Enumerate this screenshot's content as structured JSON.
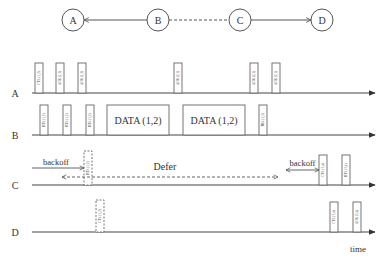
{
  "topology": {
    "nodes": [
      {
        "id": "A",
        "cx": 73,
        "cy": 20
      },
      {
        "id": "B",
        "cx": 158,
        "cy": 20
      },
      {
        "id": "C",
        "cx": 240,
        "cy": 20
      },
      {
        "id": "D",
        "cx": 322,
        "cy": 20
      }
    ],
    "links": [
      {
        "from": "B",
        "to": "A",
        "style": "solid",
        "arrow": "A"
      },
      {
        "from": "B",
        "to": "C",
        "style": "dashed",
        "arrow": "none"
      },
      {
        "from": "C",
        "to": "D",
        "style": "solid",
        "arrow": "D"
      }
    ]
  },
  "timeline": {
    "axis_x_start": 32,
    "axis_x_end": 375,
    "time_label": "time",
    "rows": [
      {
        "label": "A",
        "y": 93,
        "frames": [
          {
            "x": 35,
            "w": 8,
            "h": 30,
            "label": "CTS (1,2)",
            "style": "solid"
          },
          {
            "x": 56,
            "w": 8,
            "h": 30,
            "label": "ACK (1,2)",
            "style": "solid"
          },
          {
            "x": 78,
            "w": 8,
            "h": 30,
            "label": "ACK (1,2)",
            "style": "solid"
          },
          {
            "x": 174,
            "w": 8,
            "h": 30,
            "label": "ACK (2,1)",
            "style": "solid"
          },
          {
            "x": 250,
            "w": 8,
            "h": 30,
            "label": "ACK (2,1)",
            "style": "solid"
          },
          {
            "x": 272,
            "w": 8,
            "h": 30,
            "label": "ACK (2,1)",
            "style": "solid"
          }
        ]
      },
      {
        "label": "B",
        "y": 135,
        "frames": [
          {
            "x": 40,
            "w": 8,
            "h": 30,
            "label": "RTS (1,2)",
            "style": "solid"
          },
          {
            "x": 63,
            "w": 8,
            "h": 30,
            "label": "RTS (1,2)",
            "style": "solid"
          },
          {
            "x": 86,
            "w": 8,
            "h": 30,
            "label": "RTS (1,2)",
            "style": "solid"
          },
          {
            "x": 107,
            "w": 62,
            "h": 30,
            "label": "DATA (1,2)",
            "style": "data"
          },
          {
            "x": 183,
            "w": 62,
            "h": 30,
            "label": "DATA (1,2)",
            "style": "data"
          },
          {
            "x": 259,
            "w": 8,
            "h": 30,
            "label": "TRS (1,2)",
            "style": "solid"
          }
        ]
      },
      {
        "label": "C",
        "y": 185,
        "frames": [
          {
            "x": 84,
            "w": 8,
            "h": 34,
            "label": "RTS (1,2)",
            "style": "dashed"
          },
          {
            "x": 319,
            "w": 8,
            "h": 30,
            "label": "CTS (3,4)",
            "style": "solid"
          },
          {
            "x": 342,
            "w": 8,
            "h": 30,
            "label": "RTS (3,4)",
            "style": "solid"
          }
        ],
        "annotations": {
          "backoff_left": {
            "label": "backoff",
            "x1": 32,
            "x2": 84,
            "y": 168
          },
          "defer": {
            "label": "Defer",
            "x1": 62,
            "x2": 278,
            "y": 177,
            "text_x": 165,
            "text_y": 170
          },
          "backoff_right": {
            "label": "backoff",
            "x1": 286,
            "x2": 319,
            "y": 170
          }
        }
      },
      {
        "label": "D",
        "y": 232,
        "frames": [
          {
            "x": 96,
            "w": 8,
            "h": 32,
            "label": "CTS (1,2)",
            "style": "dashed"
          },
          {
            "x": 330,
            "w": 8,
            "h": 30,
            "label": "CTS (3,4)",
            "style": "solid"
          },
          {
            "x": 353,
            "w": 8,
            "h": 30,
            "label": "ACK (3,4)",
            "style": "solid"
          }
        ]
      }
    ]
  },
  "colors": {
    "line": "#555555",
    "frame_border": "#666666",
    "text": "#333333",
    "background": "#ffffff"
  }
}
